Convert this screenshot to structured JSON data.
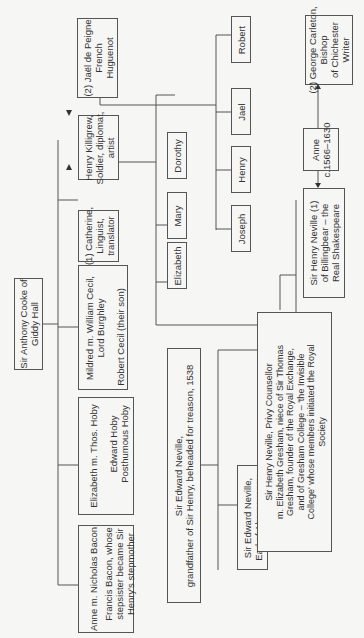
{
  "tree": {
    "root": {
      "lines": [
        "Sir Anthony Cooke of",
        "Giddy Hall"
      ]
    },
    "anne_bacon": {
      "lines": [
        "Anne m. Nicholas Bacon"
      ],
      "child_lines": [
        "Francis Bacon, whose",
        "stepsister became Sir",
        "Henry's stepmother"
      ]
    },
    "elizabeth_hoby": {
      "lines": [
        "Elizabeth m. Thos. Hoby"
      ],
      "child_lines": [
        "Edward Hoby",
        "Posthumous Hoby"
      ]
    },
    "mildred_cecil": {
      "lines": [
        "Mildred m. William Cecil,",
        "Lord Burghley"
      ],
      "child_lines": [
        "Robert Cecil (their son)"
      ]
    },
    "catherine": {
      "lines": [
        "(1) Catherine,",
        "Linguist,",
        "translator"
      ]
    },
    "henry_killigrew": {
      "lines": [
        "Henry Killigrew,",
        "Soldier, diplomat,",
        "artist"
      ]
    },
    "jael_de_peigne": {
      "lines": [
        "(2) Jaël de Peigne",
        "French",
        "Huguenot"
      ]
    },
    "children_first": [
      "Elizabeth",
      "Mary",
      "Dorothy"
    ],
    "children_second": [
      "Joseph",
      "Henry",
      "Jael",
      "Robert"
    ],
    "edward_neville_senior": {
      "lines": [
        "Sir Edward Neville,",
        "grandfather of Sir Henry, beheaded for treason, 1538"
      ]
    },
    "edward_neville_abergavenny": {
      "lines": [
        "Sir Edward Neville,",
        "Earl of Abergavenny"
      ]
    },
    "henry_neville_counsellor": {
      "lines": [
        "Sir Henry Neville, Privy Counsellor",
        "m. Elizabeth Gresham, niece of Sir Thomas",
        "Gresham, founder of the Royal Exchange,",
        "and of Gresham College – 'the Invisible",
        "College' whose members initiated the Royal",
        "Society"
      ]
    },
    "henry_neville_billingbear": {
      "lines": [
        "Sir Henry Neville  (1)",
        "of Billingbear – the",
        "Real Shakespeare"
      ]
    },
    "anne_carleton": {
      "lines": [
        "Anne",
        "c.1566–1630"
      ]
    },
    "george_carleton": {
      "lines": [
        "(2) George Carleton,",
        "Bishop",
        "of Chichester",
        "Writer"
      ]
    }
  },
  "colors": {
    "line": "#555555",
    "background": "#f6f6f4",
    "text": "#333333"
  }
}
